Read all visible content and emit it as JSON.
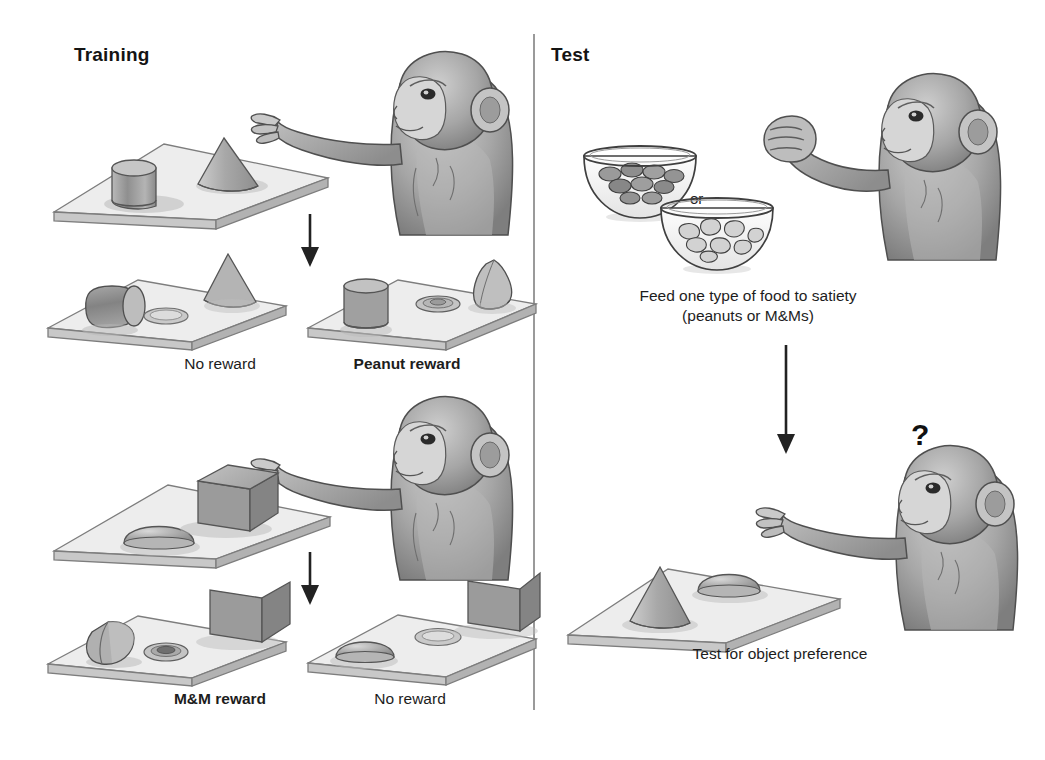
{
  "figure": {
    "type": "diagram",
    "panels": {
      "training": {
        "title": "Training",
        "rows": [
          {
            "id": "peanut-training",
            "stage_top": {
              "tray_objects": [
                "cylinder",
                "cone"
              ],
              "actor": "macaque-monkey-reaching"
            },
            "outcomes": [
              {
                "label": "No reward",
                "bold": false,
                "displaced_object": "cylinder",
                "well_contents": "empty",
                "remaining_object": "cone"
              },
              {
                "label": "Peanut reward",
                "bold": true,
                "displaced_object": "cone",
                "well_contents": "peanut",
                "remaining_object": "cylinder"
              }
            ]
          },
          {
            "id": "mm-training",
            "stage_top": {
              "tray_objects": [
                "dome",
                "cube"
              ],
              "actor": "macaque-monkey-reaching"
            },
            "outcomes": [
              {
                "label": "M&M reward",
                "bold": true,
                "displaced_object": "dome",
                "well_contents": "m-and-m",
                "remaining_object": "cube"
              },
              {
                "label": "No reward",
                "bold": false,
                "displaced_object": "dome",
                "well_contents": "empty",
                "remaining_object": "cube"
              }
            ]
          }
        ]
      },
      "test": {
        "title": "Test",
        "satiation": {
          "bowls": [
            {
              "id": "bowl-mms",
              "contents": "M&Ms",
              "shade": "dark"
            },
            {
              "id": "bowl-peanuts",
              "contents": "peanuts",
              "shade": "light"
            }
          ],
          "connector_label": "or",
          "actor": "macaque-monkey-closed-fist",
          "caption_line1": "Feed one type of food to satiety",
          "caption_line2": "(peanuts or M&Ms)"
        },
        "preference_test": {
          "tray_objects": [
            "cone",
            "dome"
          ],
          "actor": "macaque-monkey-reaching",
          "thought_marker": "?",
          "caption": "Test for object preference"
        }
      }
    },
    "colors": {
      "ink": "#1a1a1a",
      "divider": "#9a9a9a",
      "object_fill_mid": "#9d9d9d",
      "object_fill_light": "#cfcfcf",
      "tray_top": "#ededed",
      "tray_edge": "#b0b0b0",
      "monkey_fill": "#a8a8a8",
      "arrow": "#222222"
    }
  }
}
